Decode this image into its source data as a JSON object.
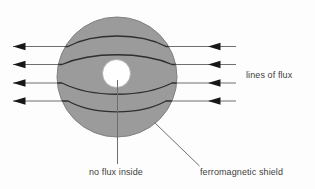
{
  "labels": {
    "lines_of_flux": "lines of flux",
    "no_flux_inside": "no flux inside",
    "ferromagnetic_shield": "ferromagnetic shield"
  },
  "flux": {
    "line_count": 4,
    "direction": "left"
  },
  "colors": {
    "background": "#fdfdfd",
    "shield_fill": "#9b9b9b",
    "shield_edge": "#818181",
    "hole_fill": "#fefefe",
    "hole_edge": "#a6a6a6",
    "flux_line_outer": "#6f6f6f",
    "flux_line_inner": "#2e2e2e",
    "arrowhead": "#171717",
    "leader_line": "#6e6e6e",
    "label_text": "#3f3f3f"
  }
}
